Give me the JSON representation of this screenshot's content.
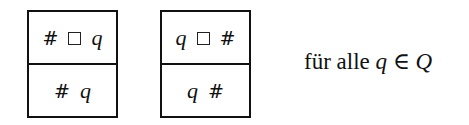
{
  "figure": {
    "boxes": [
      {
        "top": [
          "#",
          "□",
          "q"
        ],
        "bottom": [
          "#",
          "q"
        ]
      },
      {
        "top": [
          "q",
          "□",
          "#"
        ],
        "bottom": [
          "q",
          "#"
        ]
      }
    ],
    "caption": {
      "text": "für alle",
      "var": "q",
      "rel": "∈",
      "set": "Q"
    }
  }
}
